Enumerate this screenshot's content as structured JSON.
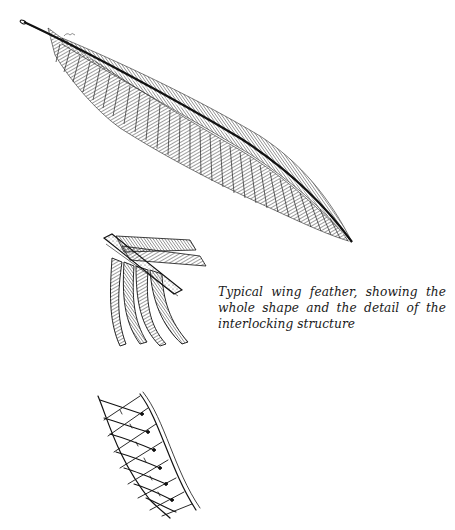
{
  "page": {
    "background": "#ffffff",
    "ink_color": "#1a1a1a"
  },
  "figures": [
    {
      "name": "whole-wing-feather",
      "description": "Long diagonal wing feather drawing with central quill"
    },
    {
      "name": "barb-detail",
      "description": "Close-up of feather shaft with barbs branching downward"
    },
    {
      "name": "interlocking-structure-detail",
      "description": "Magnified barbules showing hooked interlocking lattice"
    }
  ],
  "caption": {
    "text": "Typical wing feather, showing the whole shape and the detail of the interlocking structure"
  }
}
